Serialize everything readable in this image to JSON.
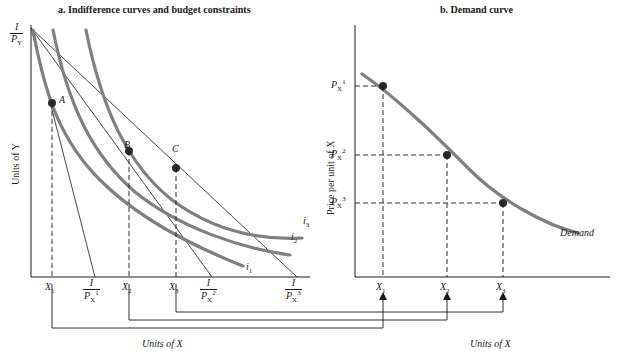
{
  "figure": {
    "panel_a_title": "a. Indifference curves and budget constraints",
    "panel_b_title": "b. Demand curve",
    "axis_y_left_a": "Units of Y",
    "axis_x_a": "Units of X",
    "axis_y_left_b": "Price per unit of X",
    "axis_x_b": "Units of X"
  },
  "panel_a": {
    "y_intercept_num": "I",
    "y_intercept_den_p": "P",
    "y_intercept_den_sub": "Y",
    "points": [
      {
        "label": "A",
        "x": 52,
        "y": 103
      },
      {
        "label": "B",
        "x": 129,
        "y": 151
      },
      {
        "label": "C",
        "x": 176,
        "y": 168
      }
    ],
    "curve_labels": [
      {
        "label": "i",
        "sub": "1"
      },
      {
        "label": "i",
        "sub": "2"
      },
      {
        "label": "i",
        "sub": "3"
      }
    ],
    "x_ticks": [
      {
        "label": "X",
        "sub": "1"
      },
      {
        "label": "X",
        "sub": "2"
      },
      {
        "label": "X",
        "sub": "3"
      }
    ],
    "budget_x_intercepts": [
      {
        "num": "I",
        "den": "P",
        "den_sub": "X",
        "den_sup": "1"
      },
      {
        "num": "I",
        "den": "P",
        "den_sub": "X",
        "den_sup": "2"
      },
      {
        "num": "I",
        "den": "P",
        "den_sub": "X",
        "den_sup": "3"
      }
    ]
  },
  "panel_b": {
    "curve_label": "Demand",
    "y_ticks": [
      {
        "label": "P",
        "sub": "X",
        "sup": "1"
      },
      {
        "label": "P",
        "sub": "X",
        "sup": "2"
      },
      {
        "label": "P",
        "sub": "X",
        "sup": "3"
      }
    ],
    "x_ticks": [
      {
        "label": "X",
        "sub": "1"
      },
      {
        "label": "X",
        "sub": "2"
      },
      {
        "label": "X",
        "sub": "3"
      }
    ]
  },
  "colors": {
    "curve_gray": "#808080",
    "axis_black": "#1a1a1a",
    "point_fill": "#2b2b2b",
    "background": "#ffffff"
  }
}
